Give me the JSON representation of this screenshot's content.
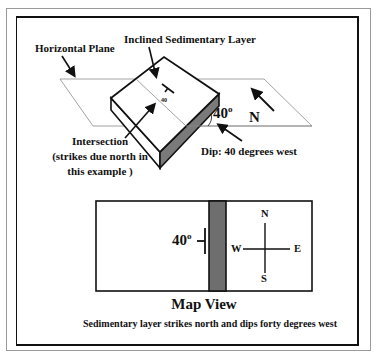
{
  "diagram": {
    "block_view": {
      "label_horizontal_plane": "Horizontal Plane",
      "label_inclined_layer": "Inclined Sedimentary Layer",
      "label_intersection_line1": "Intersection",
      "label_intersection_line2": "(strikes due north in",
      "label_intersection_line3": "this example )",
      "label_dip": "Dip: 40 degrees west",
      "dip_angle_value": "40",
      "dip_angle_degree": "o",
      "strike_dip_symbol_value": "40",
      "north_label": "N"
    },
    "map_view": {
      "dip_value": "40",
      "dip_degree": "o",
      "compass": {
        "north": "N",
        "south": "S",
        "east": "E",
        "west": "W"
      },
      "title": "Map View",
      "caption": "Sedimentary layer strikes north and dips forty degrees west"
    },
    "colors": {
      "layer_side_fill": "#7a7a7a",
      "band_fill": "#6e6e6e",
      "plane_line": "#8a8a8a",
      "ink": "#111111"
    }
  }
}
